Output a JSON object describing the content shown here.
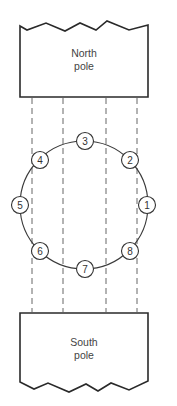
{
  "north_pole": {
    "label_line1": "North",
    "label_line2": "pole"
  },
  "south_pole": {
    "label_line1": "South",
    "label_line2": "pole"
  },
  "conductors": [
    {
      "id": "1",
      "label": "1"
    },
    {
      "id": "2",
      "label": "2"
    },
    {
      "id": "3",
      "label": "3"
    },
    {
      "id": "4",
      "label": "4"
    },
    {
      "id": "5",
      "label": "5"
    },
    {
      "id": "6",
      "label": "6"
    },
    {
      "id": "7",
      "label": "7"
    },
    {
      "id": "8",
      "label": "8"
    }
  ],
  "flux_lines_count": 4,
  "colors": {
    "line": "#2a2a2a",
    "text": "#444444",
    "background": "#ffffff"
  }
}
